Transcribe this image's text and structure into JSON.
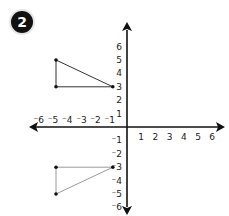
{
  "badge": {
    "label": "2",
    "bg_color": "#111111",
    "text_color": "#ffffff"
  },
  "chart_data": {
    "type": "scatter",
    "title": "",
    "xlabel": "",
    "ylabel": "",
    "xlim": [
      -6,
      6
    ],
    "ylim": [
      -6,
      6
    ],
    "grid": false,
    "x_ticks": [
      -6,
      -5,
      -4,
      -3,
      -2,
      -1,
      1,
      2,
      3,
      4,
      5,
      6
    ],
    "y_ticks": [
      6,
      5,
      4,
      3,
      2,
      1,
      -1,
      -2,
      -3,
      -4,
      -5,
      -6
    ],
    "x_tick_labels": [
      "⁻6",
      "⁻5",
      "⁻4",
      "⁻3",
      "⁻2",
      "⁻1",
      "1",
      "2",
      "3",
      "4",
      "5",
      "6"
    ],
    "y_tick_labels": [
      "6",
      "5",
      "4",
      "3",
      "2",
      "1",
      "⁻1",
      "⁻2",
      "⁻3",
      "⁻4",
      "⁻5",
      "⁻6"
    ],
    "axis_color": "#111111",
    "shapes": [
      {
        "name": "upper-triangle",
        "line_color": "#333333",
        "points": [
          [
            -5,
            5
          ],
          [
            -5,
            3
          ],
          [
            -1,
            3
          ]
        ]
      },
      {
        "name": "lower-triangle",
        "line_color": "#9a9a9a",
        "points": [
          [
            -5,
            -3
          ],
          [
            -1,
            -3
          ],
          [
            -5,
            -5
          ]
        ]
      }
    ]
  }
}
